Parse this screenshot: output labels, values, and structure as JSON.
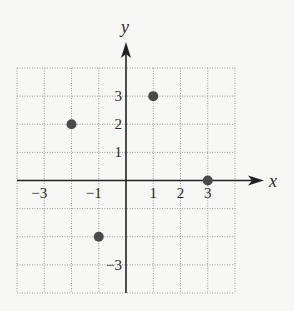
{
  "chart_data": {
    "type": "scatter",
    "title": "",
    "xlabel": "x",
    "ylabel": "y",
    "xlim": [
      -4,
      4
    ],
    "ylim": [
      -4,
      4
    ],
    "grid": true,
    "grid_style": "dotted",
    "legend": null,
    "x_tick_labels": [
      {
        "value": -3,
        "label": "−3"
      },
      {
        "value": -1,
        "label": "−1"
      },
      {
        "value": 1,
        "label": "1"
      },
      {
        "value": 2,
        "label": "2"
      },
      {
        "value": 3,
        "label": "3"
      }
    ],
    "y_tick_labels": [
      {
        "value": 3,
        "label": "3"
      },
      {
        "value": 2,
        "label": "2"
      },
      {
        "value": 1,
        "label": "1"
      },
      {
        "value": -3,
        "label": "−3"
      }
    ],
    "series": [
      {
        "name": "points",
        "points": [
          {
            "x": -2,
            "y": 2
          },
          {
            "x": 1,
            "y": 3
          },
          {
            "x": 3,
            "y": 0
          },
          {
            "x": -1,
            "y": -2
          }
        ]
      }
    ]
  },
  "colors": {
    "background": "#f7f7f5",
    "grid": "#9a9a9a",
    "axis": "#222222",
    "point": "#4a4a4a",
    "text": "#2a2a2a"
  }
}
